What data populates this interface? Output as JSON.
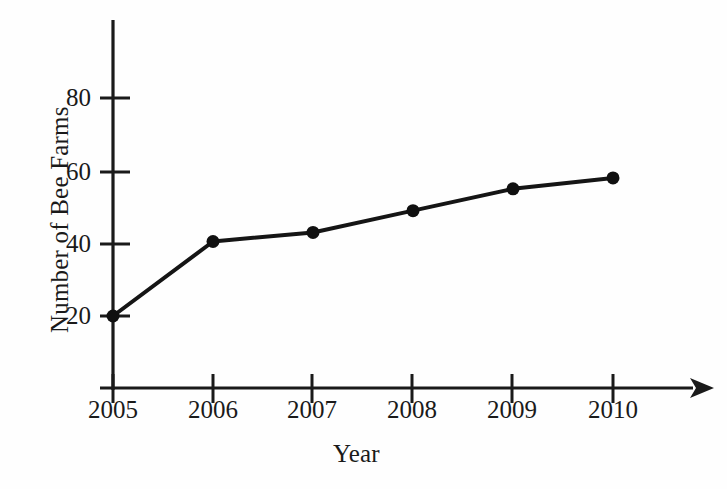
{
  "chart_data": {
    "type": "line",
    "title": "",
    "xlabel": "Year",
    "ylabel": "Number of Bee Farms",
    "categories": [
      "2005",
      "2006",
      "2007",
      "2008",
      "2009",
      "2010"
    ],
    "x": [
      2005,
      2006,
      2007,
      2008,
      2009,
      2010
    ],
    "values": [
      20,
      40.5,
      43,
      49,
      55,
      58
    ],
    "series": [
      {
        "name": "Number of Bee Farms",
        "values": [
          20,
          40.5,
          43,
          49,
          55,
          58
        ]
      }
    ],
    "xlim": [
      2005,
      2010
    ],
    "ylim": [
      0,
      95
    ],
    "x_tick_labels": [
      "2005",
      "2006",
      "2007",
      "2008",
      "2009",
      "2010"
    ],
    "y_tick_labels": [
      "20",
      "40",
      "60",
      "80"
    ],
    "y_ticks": [
      20,
      40,
      60,
      80
    ],
    "grid": false,
    "legend": false,
    "legend_position": "none",
    "marker": "filled-circle",
    "line_color": "#151515",
    "marker_color": "#101010",
    "axis_color": "#1a1a1a",
    "background_color": "#fefefe",
    "x_axis_arrow": true,
    "y_axis_arrow": false,
    "annotations": []
  },
  "axes": {
    "y_title": "Number of Bee Farms",
    "x_title": "Year"
  },
  "ticks": {
    "y": [
      {
        "label": "80",
        "value": 80
      },
      {
        "label": "60",
        "value": 60
      },
      {
        "label": "40",
        "value": 40
      },
      {
        "label": "20",
        "value": 20
      }
    ],
    "x": [
      {
        "label": "2005",
        "value": 2005
      },
      {
        "label": "2006",
        "value": 2006
      },
      {
        "label": "2007",
        "value": 2007
      },
      {
        "label": "2008",
        "value": 2008
      },
      {
        "label": "2009",
        "value": 2009
      },
      {
        "label": "2010",
        "value": 2010
      }
    ]
  }
}
